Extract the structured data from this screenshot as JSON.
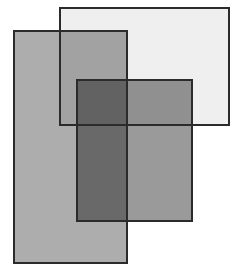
{
  "canvas": {
    "width": 244,
    "height": 279,
    "background_color": "#FFFFFF",
    "description": "Three overlapping semi-transparent gray rectangles with dark outlines"
  },
  "style": {
    "stroke_color": "#2B2B2B",
    "stroke_width": 2,
    "blend_mode": "multiply"
  },
  "shapes": [
    {
      "id": "rect-light",
      "name": "light-rectangle",
      "label": "Light rectangle",
      "x": 59,
      "y": 7,
      "width": 171,
      "height": 119,
      "fill_color": "#EFEFEF",
      "stroke_color": "#2B2B2B",
      "stroke_width": 2,
      "z_order": 1
    },
    {
      "id": "rect-gray-tall",
      "name": "tall-gray-rectangle",
      "label": "Tall gray rectangle",
      "x": 13,
      "y": 30,
      "width": 115,
      "height": 234,
      "fill_color": "#ADADAD",
      "stroke_color": "#2B2B2B",
      "stroke_width": 2,
      "z_order": 2
    },
    {
      "id": "rect-medium",
      "name": "medium-gray-rectangle",
      "label": "Medium gray rectangle",
      "x": 76,
      "y": 79,
      "width": 117,
      "height": 143,
      "fill_color": "#9A9A9A",
      "stroke_color": "#2B2B2B",
      "stroke_width": 2,
      "z_order": 3
    }
  ],
  "overlap_colors": {
    "light_only": "#EFEFEF",
    "gray_only": "#ADADAD",
    "medium_only": "#9A9A9A",
    "gray_and_light": "#8C8C8C",
    "gray_and_medium": "#3D3D3D",
    "all_three": "#3A3A3A"
  }
}
